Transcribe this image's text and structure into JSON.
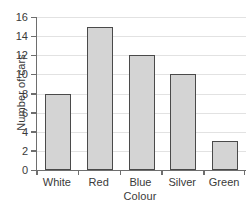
{
  "chart_data": {
    "type": "bar",
    "title": "",
    "subtitle": "",
    "xlabel": "Colour",
    "ylabel": "Number of cars",
    "categories": [
      "White",
      "Red",
      "Blue",
      "Silver",
      "Green"
    ],
    "values": [
      8,
      15,
      12,
      10,
      3
    ],
    "series": [
      {
        "name": "Number of cars",
        "values": [
          8,
          15,
          12,
          10,
          3
        ]
      }
    ],
    "ylim": [
      0,
      16
    ],
    "ytick_labels": [
      "0",
      "2",
      "4",
      "6",
      "8",
      "10",
      "12",
      "14",
      "16"
    ],
    "ytick_values": [
      0,
      2,
      4,
      6,
      8,
      10,
      12,
      14,
      16
    ],
    "ytick_step": 2,
    "grid": "horizontal",
    "legend": "none",
    "annotations": [],
    "colors": {
      "bar_fill": "#d4d4d4",
      "bar_border": "#4a4a4a",
      "gridline": "#e2e2e2",
      "axis": "#6e6e6e",
      "text": "#3a3a3a",
      "background": "#ffffff"
    }
  }
}
